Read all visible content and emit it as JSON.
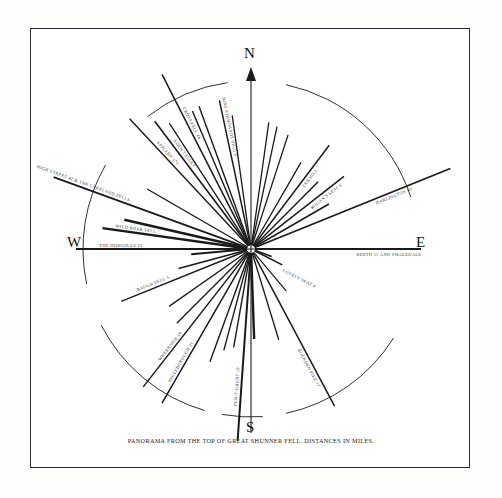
{
  "document": {
    "caption": "PANORAMA FROM THE TOP OF GREAT SHUNNER FELL. DISTANCES IN MILES."
  },
  "compass": {
    "north": "N",
    "south": "S",
    "west": "W",
    "east": "E"
  },
  "chart_data": {
    "type": "scatter",
    "title": "PANORAMA FROM THE TOP OF GREAT SHUNNER FELL. DISTANCES IN MILES.",
    "subtitle": "",
    "xlabel": "",
    "ylabel": "",
    "legend_position": "none",
    "grid": false,
    "axis_ranges": {
      "bearing_deg": [
        0,
        360
      ],
      "distance_miles": [
        3,
        46
      ]
    },
    "center_label": "GREAT SHUNNER FELL",
    "rays": [
      {
        "name": "CROSS FELL",
        "distance": 46,
        "label": "CROSS FELL 46",
        "bearing": 333,
        "length": 196,
        "weight": 1.5
      },
      {
        "name": "APPLEBY",
        "distance": 17.5,
        "label": "APPLEBY 17½",
        "bearing": 317,
        "length": 178,
        "weight": 1.4
      },
      {
        "name": "NINE STANDARDS RIGG",
        "distance": 9,
        "label": "NINE STANDARDS RIGG 9",
        "bearing": 348,
        "length": 152,
        "weight": 1.5
      },
      {
        "name": "EDEN VALLEY",
        "distance": null,
        "label": "EDEN VALLEY",
        "bearing": 323,
        "length": 160,
        "weight": 1.6
      },
      {
        "name": "HIGH STREET & THE LAKELAND FELLS",
        "distance": 42,
        "label": "HIGH STREET 42 & THE LAKELAND FELLS",
        "bearing": 290,
        "length": 210,
        "weight": 1.8
      },
      {
        "name": "WILD BOAR FELL",
        "distance": 7,
        "label": "WILD BOAR FELL 7",
        "bearing": 278,
        "length": 150,
        "weight": 2.4
      },
      {
        "name": "THE HOWGILLS",
        "distance": 22,
        "label": "THE HOWGILLS 22",
        "bearing": 270,
        "length": 175,
        "weight": 2.2
      },
      {
        "name": "BAUGH FELL",
        "distance": 5,
        "label": "BAUGH FELL 5",
        "bearing": 248,
        "length": 140,
        "weight": 1.4
      },
      {
        "name": "WHERNSIDE",
        "distance": 19,
        "label": "WHERNSIDE 19",
        "bearing": 218,
        "length": 175,
        "weight": 1.5
      },
      {
        "name": "INGLEBOROUGH",
        "distance": 21,
        "label": "INGLEBOROUGH 21",
        "bearing": 210,
        "length": 178,
        "weight": 1.5
      },
      {
        "name": "PEN-Y-GHENT",
        "distance": 18,
        "label": "PEN-Y-GHENT 18",
        "bearing": 184,
        "length": 192,
        "weight": 2.0
      },
      {
        "name": "BUCKDEN PIKE",
        "distance": 17,
        "label": "BUCKDEN PIKE 17",
        "bearing": 152,
        "length": 178,
        "weight": 1.5
      },
      {
        "name": "LOVELY SEAT",
        "distance": 4,
        "label": "LOVELY SEAT 4",
        "bearing": 117,
        "length": 35,
        "weight": 1.6
      },
      {
        "name": "REETH AND SWALEDALE",
        "distance": 11,
        "label": "REETH 11 AND SWALEDALE",
        "bearing": 90,
        "length": 170,
        "weight": 2.2
      },
      {
        "name": "DARLINGTON",
        "distance": 40,
        "label": "DARLINGTON 40",
        "bearing": 68,
        "length": 215,
        "weight": 1.8
      },
      {
        "name": "ROGAN'S SEAT",
        "distance": 6,
        "label": "ROGAN'S SEAT 6",
        "bearing": 52,
        "length": 118,
        "weight": 1.5
      },
      {
        "name": "TAN HILL",
        "distance": 7,
        "label": "TAN HILL 7",
        "bearing": 37,
        "length": 130,
        "weight": 1.5
      }
    ],
    "extra_rays": [
      {
        "bearing": 340,
        "length": 152,
        "weight": 1.4
      },
      {
        "bearing": 337,
        "length": 150,
        "weight": 1.4
      },
      {
        "bearing": 327,
        "length": 150,
        "weight": 1.3
      },
      {
        "bearing": 300,
        "length": 120,
        "weight": 1.4
      },
      {
        "bearing": 283,
        "length": 130,
        "weight": 2.6
      },
      {
        "bearing": 265,
        "length": 60,
        "weight": 2.0
      },
      {
        "bearing": 255,
        "length": 75,
        "weight": 1.6
      },
      {
        "bearing": 235,
        "length": 100,
        "weight": 1.3
      },
      {
        "bearing": 225,
        "length": 105,
        "weight": 1.3
      },
      {
        "bearing": 200,
        "length": 120,
        "weight": 1.4
      },
      {
        "bearing": 195,
        "length": 105,
        "weight": 1.4
      },
      {
        "bearing": 190,
        "length": 100,
        "weight": 1.4
      },
      {
        "bearing": 178,
        "length": 90,
        "weight": 2.4
      },
      {
        "bearing": 163,
        "length": 95,
        "weight": 1.4
      },
      {
        "bearing": 140,
        "length": 55,
        "weight": 1.2
      },
      {
        "bearing": 110,
        "length": 22,
        "weight": 1.6
      },
      {
        "bearing": 60,
        "length": 90,
        "weight": 1.5
      },
      {
        "bearing": 45,
        "length": 95,
        "weight": 1.4
      },
      {
        "bearing": 30,
        "length": 100,
        "weight": 1.3
      },
      {
        "bearing": 18,
        "length": 120,
        "weight": 1.3
      },
      {
        "bearing": 12,
        "length": 125,
        "weight": 1.3
      },
      {
        "bearing": 8,
        "length": 128,
        "weight": 1.3
      },
      {
        "bearing": 352,
        "length": 135,
        "weight": 1.3
      }
    ],
    "arc_segments": [
      {
        "from_bearing": 352,
        "to_bearing": 322,
        "radius": 168
      },
      {
        "from_bearing": 300,
        "to_bearing": 258,
        "radius": 168
      },
      {
        "from_bearing": 243,
        "to_bearing": 196,
        "radius": 168
      },
      {
        "from_bearing": 190,
        "to_bearing": 176,
        "radius": 168
      },
      {
        "from_bearing": 168,
        "to_bearing": 122,
        "radius": 168
      },
      {
        "from_bearing": 72,
        "to_bearing": 12,
        "radius": 168
      }
    ],
    "colors": {
      "ink": "#1a1a1a",
      "ray": "#1a1a1a",
      "label": "#333333",
      "paper": "#ffffff",
      "border": "#2a2a2a"
    }
  }
}
